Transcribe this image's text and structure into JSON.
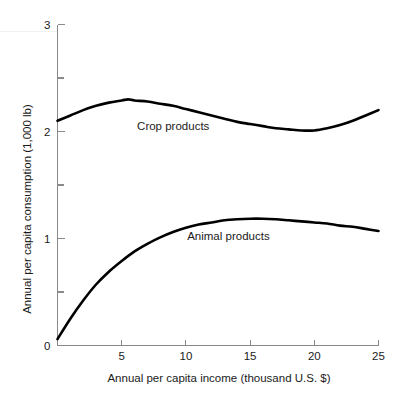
{
  "chart_data": {
    "type": "line",
    "title": "",
    "subtitle": "",
    "xlabel": "Annual per capita income (thousand U.S. $)",
    "ylabel": "Annual per capita consumption (1,000 lb)",
    "xlim": [
      0,
      25
    ],
    "ylim": [
      0,
      3
    ],
    "xticks": [
      5,
      10,
      15,
      20,
      25
    ],
    "xtick_labels": [
      "5",
      "10",
      "15",
      "20",
      "25"
    ],
    "yticks": [
      0,
      1,
      2,
      3
    ],
    "ytick_labels": [
      "0",
      "1",
      "2",
      "3"
    ],
    "yminor_ticks": [
      0.5,
      1.5,
      2.5
    ],
    "grid": false,
    "legend_position": "inline-annotations",
    "line_color": "#000000",
    "axis_color": "#8a8a8a",
    "background_color": "#ffffff",
    "series": [
      {
        "name": "Crop products",
        "label_text": "Crop products",
        "label_x": 6.2,
        "label_y": 2.05,
        "x": [
          0,
          1,
          2,
          3,
          4,
          5,
          5.5,
          6,
          7,
          8,
          9,
          10,
          11,
          12,
          13,
          14,
          15,
          16,
          17,
          18,
          19,
          20,
          21,
          22,
          23,
          24,
          25
        ],
        "values": [
          2.1,
          2.15,
          2.2,
          2.24,
          2.27,
          2.29,
          2.3,
          2.29,
          2.28,
          2.26,
          2.24,
          2.21,
          2.18,
          2.15,
          2.12,
          2.09,
          2.07,
          2.05,
          2.03,
          2.02,
          2.01,
          2.01,
          2.03,
          2.06,
          2.1,
          2.15,
          2.2
        ]
      },
      {
        "name": "Animal products",
        "label_text": "Animal products",
        "label_x": 10.1,
        "label_y": 1.02,
        "x": [
          0,
          1,
          2,
          3,
          4,
          5,
          6,
          7,
          8,
          9,
          10,
          11,
          12,
          13,
          14,
          15,
          16,
          17,
          18,
          19,
          20,
          21,
          22,
          23,
          24,
          25
        ],
        "values": [
          0.06,
          0.25,
          0.42,
          0.57,
          0.69,
          0.79,
          0.88,
          0.95,
          1.01,
          1.06,
          1.1,
          1.13,
          1.15,
          1.17,
          1.18,
          1.185,
          1.185,
          1.18,
          1.17,
          1.16,
          1.15,
          1.14,
          1.12,
          1.11,
          1.09,
          1.07
        ]
      }
    ]
  }
}
